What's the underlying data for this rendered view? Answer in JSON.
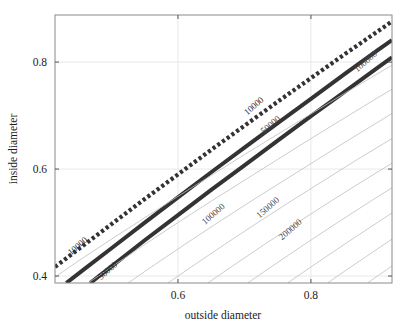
{
  "chart_data": {
    "type": "line",
    "title": "",
    "subtitle": "",
    "xlabel": "outside diameter",
    "ylabel": "inside diameter",
    "xlim": [
      0.415,
      0.922
    ],
    "ylim": [
      0.387,
      0.888
    ],
    "xticks": [
      0.6,
      0.8
    ],
    "xticklabels": [
      "0.6",
      "0.8"
    ],
    "yticks": [
      0.4,
      0.6,
      0.8
    ],
    "yticklabels": [
      "0.4",
      "0.6",
      "0.8"
    ],
    "grid": true,
    "legend": "none",
    "contour_levels": [
      10000,
      50000,
      100000,
      150000,
      200000,
      1000000
    ],
    "annotations": [
      {
        "text": "10000",
        "x": 0.452,
        "y": 0.452,
        "style": "dotted-contour"
      },
      {
        "text": "10000",
        "x": 0.717,
        "y": 0.714,
        "style": "dotted-contour"
      },
      {
        "text": "50000",
        "x": 0.497,
        "y": 0.406,
        "style": "solid-contour"
      },
      {
        "text": "50000",
        "x": 0.742,
        "y": 0.679,
        "style": "thin-contour"
      },
      {
        "text": "100000",
        "x": 0.656,
        "y": 0.512,
        "style": "thin-contour"
      },
      {
        "text": "150000",
        "x": 0.738,
        "y": 0.524,
        "style": "thin-contour"
      },
      {
        "text": "200000",
        "x": 0.772,
        "y": 0.483,
        "style": "thin-contour"
      },
      {
        "text": "100000",
        "x": 0.885,
        "y": 0.797,
        "style": "thin-contour"
      }
    ],
    "series": [
      {
        "name": "10000",
        "style": "dotted-thick",
        "color": "#333333",
        "points": [
          [
            0.415,
            0.417
          ],
          [
            0.45,
            0.45
          ],
          [
            0.5,
            0.497
          ],
          [
            0.55,
            0.544
          ],
          [
            0.6,
            0.59
          ],
          [
            0.65,
            0.636
          ],
          [
            0.7,
            0.681
          ],
          [
            0.75,
            0.726
          ],
          [
            0.8,
            0.77
          ],
          [
            0.85,
            0.814
          ],
          [
            0.9,
            0.857
          ],
          [
            0.922,
            0.876
          ]
        ]
      },
      {
        "name": "50000-upper",
        "style": "solid-thick",
        "color": "#333333",
        "points": [
          [
            0.432,
            0.387
          ],
          [
            0.46,
            0.414
          ],
          [
            0.5,
            0.452
          ],
          [
            0.55,
            0.5
          ],
          [
            0.6,
            0.547
          ],
          [
            0.65,
            0.594
          ],
          [
            0.7,
            0.64
          ],
          [
            0.75,
            0.686
          ],
          [
            0.8,
            0.731
          ],
          [
            0.85,
            0.777
          ],
          [
            0.9,
            0.822
          ],
          [
            0.922,
            0.841
          ]
        ]
      },
      {
        "name": "50000-lower",
        "style": "solid-thick",
        "color": "#333333",
        "points": [
          [
            0.468,
            0.387
          ],
          [
            0.5,
            0.418
          ],
          [
            0.55,
            0.467
          ],
          [
            0.6,
            0.514
          ],
          [
            0.65,
            0.561
          ],
          [
            0.7,
            0.607
          ],
          [
            0.75,
            0.653
          ],
          [
            0.8,
            0.699
          ],
          [
            0.85,
            0.744
          ],
          [
            0.9,
            0.789
          ],
          [
            0.922,
            0.809
          ]
        ]
      },
      {
        "name": "thin-1",
        "style": "solid-thin",
        "color": "#bfbfbf",
        "points": [
          [
            0.415,
            0.398
          ],
          [
            0.45,
            0.428
          ],
          [
            0.5,
            0.469
          ],
          [
            0.55,
            0.509
          ],
          [
            0.6,
            0.549
          ],
          [
            0.65,
            0.588
          ],
          [
            0.7,
            0.627
          ],
          [
            0.75,
            0.665
          ],
          [
            0.8,
            0.703
          ],
          [
            0.85,
            0.741
          ],
          [
            0.9,
            0.778
          ],
          [
            0.922,
            0.794
          ]
        ]
      },
      {
        "name": "thin-2",
        "style": "solid-thin",
        "color": "#bfbfbf",
        "points": [
          [
            0.465,
            0.387
          ],
          [
            0.5,
            0.417
          ],
          [
            0.55,
            0.459
          ],
          [
            0.6,
            0.5
          ],
          [
            0.65,
            0.54
          ],
          [
            0.7,
            0.579
          ],
          [
            0.75,
            0.618
          ],
          [
            0.8,
            0.657
          ],
          [
            0.85,
            0.695
          ],
          [
            0.9,
            0.733
          ],
          [
            0.922,
            0.749
          ]
        ]
      },
      {
        "name": "thin-3",
        "style": "solid-thin",
        "color": "#bfbfbf",
        "points": [
          [
            0.525,
            0.387
          ],
          [
            0.56,
            0.417
          ],
          [
            0.61,
            0.459
          ],
          [
            0.66,
            0.5
          ],
          [
            0.71,
            0.54
          ],
          [
            0.76,
            0.579
          ],
          [
            0.81,
            0.618
          ],
          [
            0.86,
            0.657
          ],
          [
            0.9,
            0.687
          ],
          [
            0.922,
            0.704
          ]
        ]
      },
      {
        "name": "thin-4",
        "style": "solid-thin",
        "color": "#bfbfbf",
        "points": [
          [
            0.585,
            0.387
          ],
          [
            0.62,
            0.417
          ],
          [
            0.67,
            0.459
          ],
          [
            0.72,
            0.5
          ],
          [
            0.77,
            0.54
          ],
          [
            0.82,
            0.579
          ],
          [
            0.87,
            0.618
          ],
          [
            0.922,
            0.657
          ]
        ]
      },
      {
        "name": "thin-5",
        "style": "solid-thin",
        "color": "#bfbfbf",
        "points": [
          [
            0.645,
            0.387
          ],
          [
            0.68,
            0.417
          ],
          [
            0.73,
            0.459
          ],
          [
            0.78,
            0.5
          ],
          [
            0.83,
            0.54
          ],
          [
            0.88,
            0.579
          ],
          [
            0.922,
            0.611
          ]
        ]
      },
      {
        "name": "thin-6",
        "style": "solid-thin",
        "color": "#bfbfbf",
        "points": [
          [
            0.705,
            0.387
          ],
          [
            0.74,
            0.417
          ],
          [
            0.79,
            0.459
          ],
          [
            0.84,
            0.5
          ],
          [
            0.89,
            0.54
          ],
          [
            0.922,
            0.565
          ]
        ]
      },
      {
        "name": "thin-7",
        "style": "solid-thin",
        "color": "#bfbfbf",
        "points": [
          [
            0.765,
            0.387
          ],
          [
            0.8,
            0.417
          ],
          [
            0.85,
            0.459
          ],
          [
            0.9,
            0.5
          ],
          [
            0.922,
            0.518
          ]
        ]
      },
      {
        "name": "thin-8",
        "style": "solid-thin",
        "color": "#bfbfbf",
        "points": [
          [
            0.825,
            0.387
          ],
          [
            0.86,
            0.417
          ],
          [
            0.91,
            0.459
          ],
          [
            0.922,
            0.469
          ]
        ]
      },
      {
        "name": "thin-9",
        "style": "solid-thin",
        "color": "#bfbfbf",
        "points": [
          [
            0.885,
            0.387
          ],
          [
            0.92,
            0.417
          ],
          [
            0.922,
            0.419
          ]
        ]
      }
    ]
  }
}
